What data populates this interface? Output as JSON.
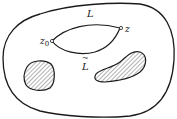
{
  "diagram": {
    "type": "domain-with-holes",
    "labels": {
      "upper_curve": "L",
      "lower_curve": "L",
      "lower_curve_accent": "~",
      "start_point": "z",
      "start_point_sub": "0",
      "end_point": "z"
    },
    "colors": {
      "stroke": "#1a1a1a",
      "hatch": "#555555",
      "fill": "#ffffff"
    },
    "elements": [
      "outer-region-boundary",
      "path-L-upper",
      "path-L-tilde-lower",
      "point-z0",
      "point-z",
      "hole-left-hatched",
      "hole-right-hatched"
    ]
  }
}
